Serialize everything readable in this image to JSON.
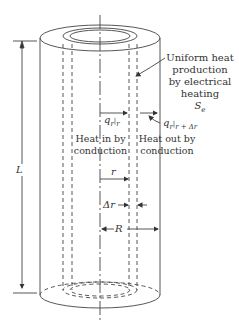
{
  "annotation": {
    "line1": "Uniform heat",
    "line2": "production",
    "line3": "by electrical",
    "line4": "heating",
    "symbol": "S",
    "symbol_sub": "e"
  },
  "flux": {
    "in_main": "q",
    "in_sub": "r",
    "in_eval": "r",
    "out_main": "q",
    "out_sub": "r",
    "out_eval": "r + Δr"
  },
  "heat_in": {
    "line1": "Heat in by",
    "line2": "conduction"
  },
  "heat_out": {
    "line1": "Heat out by",
    "line2": "conduction"
  },
  "dims": {
    "L": "L",
    "r": "r",
    "dr": "Δr",
    "R": "R"
  },
  "colors": {
    "stroke": "#444444",
    "background": "#ffffff"
  }
}
